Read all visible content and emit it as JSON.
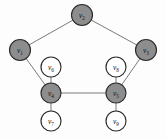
{
  "figure": {
    "background_color": "#fdfdfd",
    "width": 166,
    "height": 139,
    "shaded_node_color": "#8d8d8d",
    "plain_node_color": "#ffffff",
    "node_stroke_color": "#2b2b2b",
    "edge_color": "#6b6b6b"
  },
  "graph_data": {
    "type": "graph",
    "directed": false,
    "node_count": 9,
    "edge_count": 10,
    "nodes": [
      {
        "id": "v1",
        "label": "v",
        "subscript": "1",
        "x": 20,
        "y": 50,
        "r": 10.5,
        "shaded": true
      },
      {
        "id": "v2",
        "label": "v",
        "subscript": "2",
        "x": 82,
        "y": 15,
        "r": 10.5,
        "shaded": true
      },
      {
        "id": "v3",
        "label": "v",
        "subscript": "3",
        "x": 146,
        "y": 50,
        "r": 10.5,
        "shaded": true
      },
      {
        "id": "v4",
        "label": "v",
        "subscript": "4",
        "x": 51,
        "y": 93,
        "r": 10.0,
        "shaded": true
      },
      {
        "id": "v5",
        "label": "v",
        "subscript": "5",
        "x": 116,
        "y": 93,
        "r": 10.0,
        "shaded": true
      },
      {
        "id": "v6",
        "label": "v",
        "subscript": "6",
        "x": 51,
        "y": 67,
        "r": 10.0,
        "shaded": false
      },
      {
        "id": "v7",
        "label": "v",
        "subscript": "7",
        "x": 51,
        "y": 121,
        "r": 10.0,
        "shaded": false
      },
      {
        "id": "v8",
        "label": "v",
        "subscript": "8",
        "x": 116,
        "y": 67,
        "r": 10.0,
        "shaded": false
      },
      {
        "id": "v9",
        "label": "v",
        "subscript": "9",
        "x": 116,
        "y": 121,
        "r": 10.0,
        "shaded": false
      }
    ],
    "edges": [
      {
        "source": "v1",
        "target": "v2"
      },
      {
        "source": "v2",
        "target": "v3"
      },
      {
        "source": "v1",
        "target": "v4"
      },
      {
        "source": "v3",
        "target": "v5"
      },
      {
        "source": "v4",
        "target": "v5"
      },
      {
        "source": "v6",
        "target": "v4"
      },
      {
        "source": "v4",
        "target": "v7"
      },
      {
        "source": "v8",
        "target": "v5"
      },
      {
        "source": "v5",
        "target": "v9"
      }
    ],
    "shaded_nodes": [
      "v1",
      "v2",
      "v3",
      "v4",
      "v5"
    ],
    "plain_nodes": [
      "v6",
      "v7",
      "v8",
      "v9"
    ]
  }
}
